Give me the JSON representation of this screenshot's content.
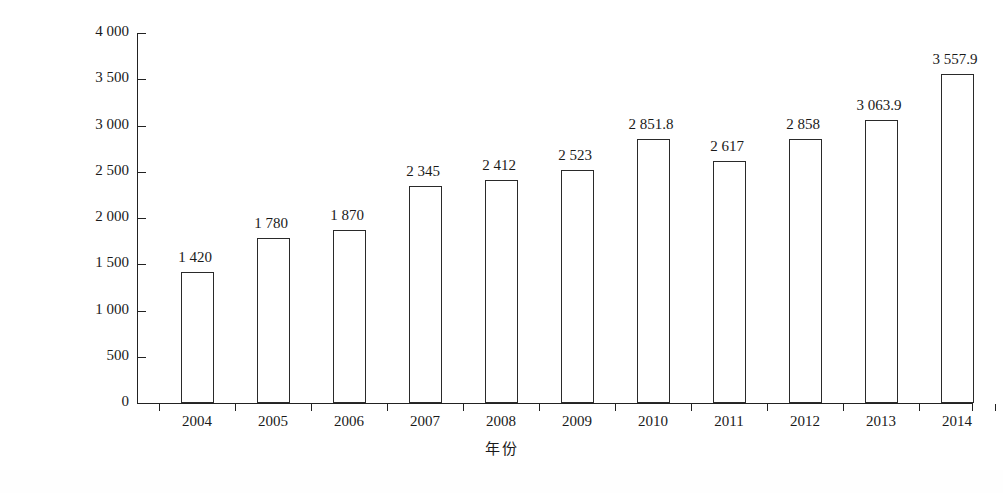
{
  "chart_data": {
    "type": "bar",
    "title": "",
    "xlabel": "年份",
    "ylabel": "产量/万台",
    "categories": [
      "2004",
      "2005",
      "2006",
      "2007",
      "2008",
      "2009",
      "2010",
      "2011",
      "2012",
      "2013",
      "2014"
    ],
    "values": [
      1420,
      1780,
      1870,
      2345,
      2412,
      2523,
      2851.8,
      2617,
      2858,
      3063.9,
      3557.9
    ],
    "value_labels": [
      "1 420",
      "1 780",
      "1 870",
      "2 345",
      "2 412",
      "2 523",
      "2 851.8",
      "2 617",
      "2 858",
      "3 063.9",
      "3 557.9"
    ],
    "ylim": [
      0,
      4000
    ],
    "ytick_values": [
      0,
      500,
      1000,
      1500,
      2000,
      2500,
      3000,
      3500,
      4000
    ],
    "ytick_labels": [
      "0",
      "500",
      "1 000",
      "1 500",
      "2 000",
      "2 500",
      "3 000",
      "3 500",
      "4 000"
    ],
    "grid": false,
    "legend": "none",
    "bar_style": "outline",
    "colors": {
      "background": "#ffffff",
      "bar_fill": "#ffffff",
      "bar_outline": "#2a2a2a",
      "axis": "#222222",
      "text": "#1a1a1a"
    }
  }
}
